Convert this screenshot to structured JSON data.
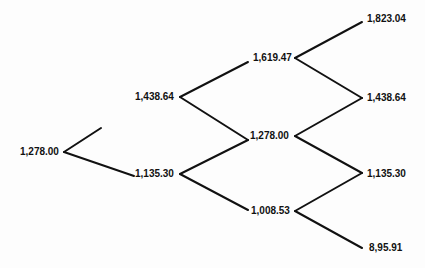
{
  "tree": {
    "type": "binomial-tree",
    "edge_color": "#111111",
    "nodes": {
      "n0": "1,278.00",
      "u1": "1,438.64",
      "d1": "1,135.30",
      "uu2": "1,619.47",
      "ud2": "1,278.00",
      "dd2": "1,008.53",
      "uuu3": "1,823.04",
      "uud3": "1,438.64",
      "udd3": "1,135.30",
      "ddd3": "8,95.91"
    }
  }
}
